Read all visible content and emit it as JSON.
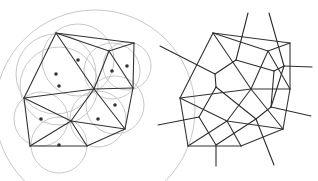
{
  "figure": {
    "left_panel": {
      "name": "delaunay-triangulation-with-circumcircles",
      "vertices": [
        [
          56,
          33
        ],
        [
          134,
          43
        ],
        [
          109,
          51
        ],
        [
          94,
          89
        ],
        [
          133,
          88
        ],
        [
          24,
          98
        ],
        [
          71,
          121
        ],
        [
          125,
          129
        ],
        [
          30,
          146
        ],
        [
          87,
          146
        ]
      ],
      "edges": [
        [
          0,
          1
        ],
        [
          0,
          2
        ],
        [
          2,
          1
        ],
        [
          0,
          3
        ],
        [
          0,
          5
        ],
        [
          2,
          3
        ],
        [
          2,
          4
        ],
        [
          1,
          4
        ],
        [
          3,
          4
        ],
        [
          5,
          3
        ],
        [
          5,
          6
        ],
        [
          3,
          6
        ],
        [
          3,
          7
        ],
        [
          4,
          7
        ],
        [
          6,
          7
        ],
        [
          5,
          8
        ],
        [
          6,
          8
        ],
        [
          6,
          9
        ],
        [
          8,
          9
        ],
        [
          7,
          9
        ]
      ],
      "circumcenters": [
        [
          78,
          60
        ],
        [
          56,
          74
        ],
        [
          59,
          86
        ],
        [
          112,
          71
        ],
        [
          127,
          66
        ],
        [
          115,
          105
        ],
        [
          98,
          119
        ],
        [
          41,
          119
        ],
        [
          59,
          145
        ]
      ],
      "circle_radii": [
        36,
        40,
        39,
        28,
        24,
        29,
        28,
        27,
        28
      ],
      "big_arc": {
        "cx": 95,
        "cy": 110,
        "r": 100
      },
      "colors": {
        "edge": "#333333",
        "circle": "#c8c8c8",
        "dot": "#333333"
      }
    },
    "right_panel": {
      "name": "voronoi-diagram-overlay",
      "vertices": [
        [
          213,
          33
        ],
        [
          290,
          43
        ],
        [
          268,
          51
        ],
        [
          251,
          89
        ],
        [
          290,
          89
        ],
        [
          180,
          98
        ],
        [
          227,
          121
        ],
        [
          283,
          129
        ],
        [
          188,
          146
        ],
        [
          241,
          146
        ]
      ],
      "edges": [
        [
          0,
          1
        ],
        [
          0,
          2
        ],
        [
          2,
          1
        ],
        [
          0,
          3
        ],
        [
          0,
          5
        ],
        [
          2,
          3
        ],
        [
          2,
          4
        ],
        [
          1,
          4
        ],
        [
          3,
          4
        ],
        [
          5,
          3
        ],
        [
          5,
          6
        ],
        [
          3,
          6
        ],
        [
          3,
          7
        ],
        [
          4,
          7
        ],
        [
          6,
          7
        ],
        [
          5,
          8
        ],
        [
          6,
          8
        ],
        [
          6,
          9
        ],
        [
          8,
          9
        ],
        [
          7,
          9
        ]
      ],
      "voronoi_nodes": [
        [
          236,
          60
        ],
        [
          215,
          74
        ],
        [
          216,
          87
        ],
        [
          274,
          71
        ],
        [
          284,
          66
        ],
        [
          271,
          107
        ],
        [
          256,
          119
        ],
        [
          199,
          117
        ],
        [
          216,
          145
        ]
      ],
      "voronoi_edges": [
        [
          0,
          1
        ],
        [
          0,
          3
        ],
        [
          1,
          2
        ],
        [
          3,
          4
        ],
        [
          3,
          5
        ],
        [
          2,
          6
        ],
        [
          2,
          7
        ],
        [
          5,
          6
        ],
        [
          6,
          8
        ],
        [
          7,
          8
        ],
        [
          4,
          5
        ]
      ],
      "voronoi_rays": [
        [
          0,
          248,
          13
        ],
        [
          4,
          269,
          13
        ],
        [
          1,
          160,
          46
        ],
        [
          4,
          312,
          67
        ],
        [
          7,
          158,
          125
        ],
        [
          5,
          311,
          116
        ],
        [
          8,
          216,
          166
        ],
        [
          6,
          274,
          165
        ]
      ],
      "colors": {
        "edge": "#333333",
        "voronoi": "#2c2c2c"
      }
    }
  }
}
